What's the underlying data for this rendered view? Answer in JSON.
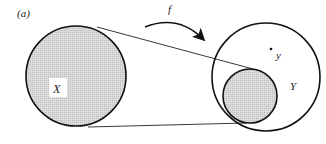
{
  "figure": {
    "panel_label": "(a)",
    "map_label": "f",
    "domain_label": "X",
    "codomain_label": "Y",
    "point_label": "y",
    "colors": {
      "stroke": "#111111",
      "fill_shaded": "#d4d4d4",
      "background": "#ffffff"
    }
  }
}
